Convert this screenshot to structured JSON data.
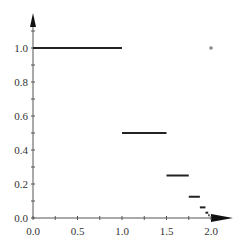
{
  "chart_data": {
    "type": "line",
    "title": "",
    "xlabel": "",
    "ylabel": "",
    "xlim": [
      0,
      2.0
    ],
    "ylim": [
      0,
      1.0
    ],
    "grid": false,
    "x_ticks": [
      "0.0",
      "0.5",
      "1.0",
      "1.5",
      "2.0"
    ],
    "y_ticks": [
      "0.0",
      "0.2",
      "0.4",
      "0.6",
      "0.8",
      "1.0"
    ],
    "series": [
      {
        "name": "step segments",
        "segments": [
          {
            "x0": 0.0,
            "x1": 1.0,
            "y": 1.0
          },
          {
            "x0": 1.0,
            "x1": 1.5,
            "y": 0.5
          },
          {
            "x0": 1.5,
            "x1": 1.75,
            "y": 0.25
          },
          {
            "x0": 1.75,
            "x1": 1.875,
            "y": 0.125
          },
          {
            "x0": 1.875,
            "x1": 1.9375,
            "y": 0.0625
          },
          {
            "x0": 1.9375,
            "x1": 1.96875,
            "y": 0.03125
          },
          {
            "x0": 1.96875,
            "x1": 1.984375,
            "y": 0.015625
          }
        ]
      },
      {
        "name": "isolated point",
        "points": [
          {
            "x": 2.0,
            "y": 1.0
          }
        ]
      }
    ]
  }
}
